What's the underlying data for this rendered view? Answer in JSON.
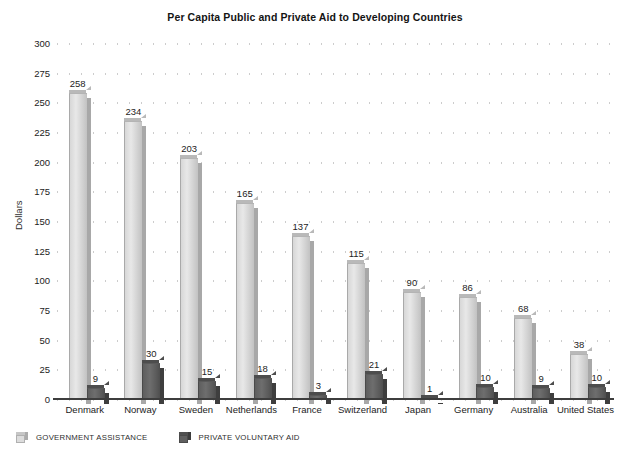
{
  "chart_data": {
    "type": "bar",
    "title": "Per Capita Public and Private Aid to Developing Countries",
    "xlabel": "",
    "ylabel": "Dollars",
    "ylim": [
      0,
      300
    ],
    "ytick_step": 25,
    "yticks": [
      300,
      275,
      250,
      225,
      200,
      175,
      150,
      125,
      100,
      75,
      50,
      25,
      0
    ],
    "grid": "horizontal-dotted",
    "legend_position": "bottom-left",
    "categories": [
      "Denmark",
      "Norway",
      "Sweden",
      "Netherlands",
      "France",
      "Switzerland",
      "Japan",
      "Germany",
      "Australia",
      "United States"
    ],
    "series": [
      {
        "name": "GOVERNMENT ASSISTANCE",
        "color": "#d7d7d7",
        "values": [
          258,
          234,
          203,
          165,
          137,
          115,
          90,
          86,
          68,
          38
        ]
      },
      {
        "name": "PRIVATE VOLUNTARY AID",
        "color": "#5e5e5e",
        "values": [
          9,
          30,
          15,
          18,
          3,
          21,
          1,
          10,
          9,
          10
        ]
      }
    ]
  },
  "legend": {
    "items": [
      {
        "label": "GOVERNMENT ASSISTANCE"
      },
      {
        "label": "PRIVATE VOLUNTARY AID"
      }
    ]
  }
}
